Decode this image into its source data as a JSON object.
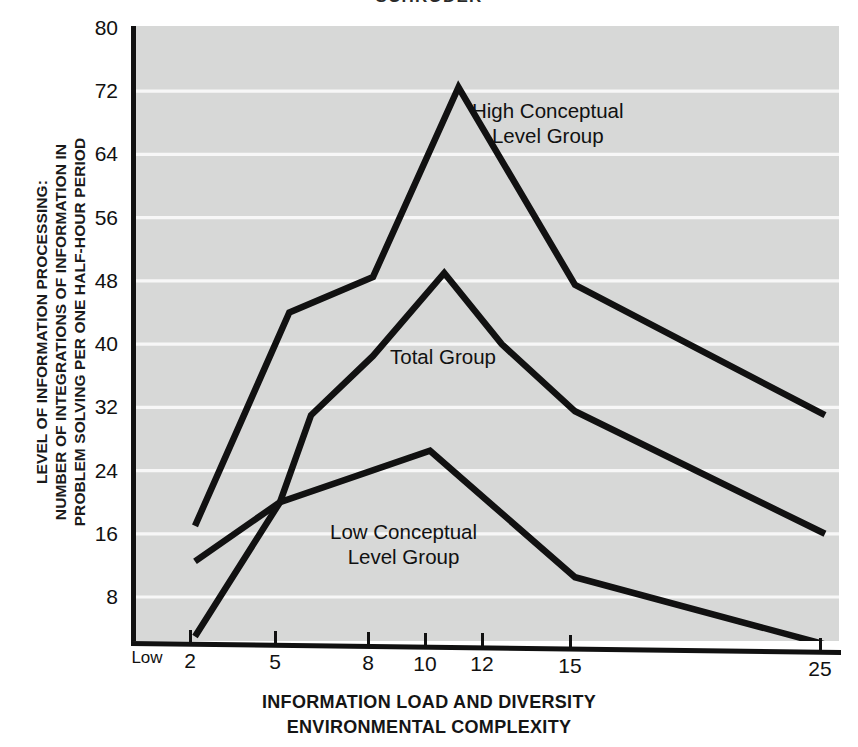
{
  "title": "SCHRODER",
  "axes": {
    "ylabel_lines": [
      "LEVEL OF INFORMATION PROCESSING:",
      "NUMBER OF INTEGRATIONS OF INFORMATION IN",
      "PROBLEM SOLVING PER ONE HALF-HOUR PERIOD"
    ],
    "xlabel_lines": [
      "INFORMATION LOAD AND DIVERSITY",
      "ENVIRONMENTAL COMPLEXITY"
    ],
    "low_marker": "Low"
  },
  "annotations": [
    {
      "name": "high-conceptual-label",
      "lines": [
        "High Conceptual",
        "Level Group"
      ],
      "x": 472,
      "y": 98
    },
    {
      "name": "total-group-label",
      "lines": [
        "Total Group"
      ],
      "x": 390,
      "y": 344
    },
    {
      "name": "low-conceptual-label",
      "lines": [
        "Low Conceptual",
        "Level Group"
      ],
      "x": 330,
      "y": 519
    }
  ],
  "style": {
    "plot_background": "#d7d8d7",
    "gridline_color": "#f7f7f7",
    "line_color": "#111111",
    "axis_color": "#111111",
    "page_background": "#ffffff"
  },
  "chart_data": {
    "type": "line",
    "title": "SCHRODER",
    "xlabel": "INFORMATION LOAD AND DIVERSITY / ENVIRONMENTAL COMPLEXITY",
    "ylabel": "LEVEL OF INFORMATION PROCESSING: NUMBER OF INTEGRATIONS OF INFORMATION IN PROBLEM SOLVING PER ONE HALF-HOUR PERIOD",
    "x_tick_labels": [
      "Low",
      "2",
      "5",
      "8",
      "10",
      "12",
      "15",
      "25"
    ],
    "x_tick_values": [
      null,
      2,
      5,
      8,
      10,
      12,
      15,
      25
    ],
    "y_tick_labels": [
      "8",
      "16",
      "24",
      "32",
      "40",
      "48",
      "56",
      "64",
      "72",
      "80"
    ],
    "y_tick_values": [
      8,
      16,
      24,
      32,
      40,
      48,
      56,
      64,
      72,
      80
    ],
    "xlim": [
      1.2,
      25.6
    ],
    "ylim": [
      0,
      80
    ],
    "grid": "horizontal",
    "legend": "inline-annotations",
    "series": [
      {
        "name": "High Conceptual Level Group",
        "points": [
          {
            "x": 2,
            "y": 17
          },
          {
            "x": 5.3,
            "y": 44
          },
          {
            "x": 8,
            "y": 48.5
          },
          {
            "x": 11,
            "y": 72.5
          },
          {
            "x": 15,
            "y": 47.5
          },
          {
            "x": 25,
            "y": 31
          }
        ]
      },
      {
        "name": "Total Group",
        "points": [
          {
            "x": 2,
            "y": 12.5
          },
          {
            "x": 5,
            "y": 20
          },
          {
            "x": 6,
            "y": 31
          },
          {
            "x": 8,
            "y": 38.5
          },
          {
            "x": 10.5,
            "y": 49
          },
          {
            "x": 12.5,
            "y": 40
          },
          {
            "x": 15,
            "y": 31.5
          },
          {
            "x": 25,
            "y": 16
          }
        ]
      },
      {
        "name": "Low Conceptual Level Group",
        "points": [
          {
            "x": 2,
            "y": 3
          },
          {
            "x": 5,
            "y": 20
          },
          {
            "x": 10,
            "y": 26.5
          },
          {
            "x": 15,
            "y": 10.5
          },
          {
            "x": 25,
            "y": 2
          }
        ]
      }
    ]
  }
}
